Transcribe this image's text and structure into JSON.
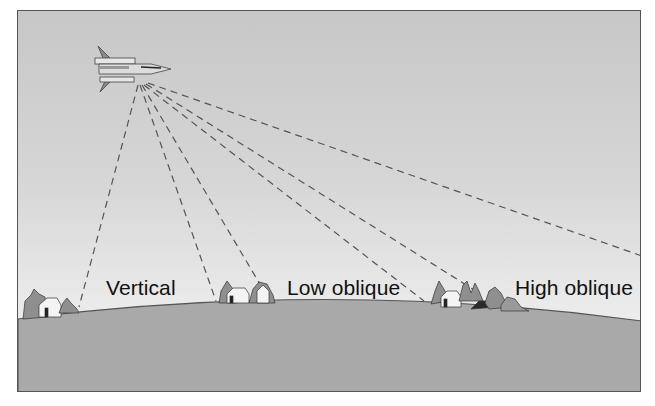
{
  "diagram": {
    "labels": {
      "vertical": "Vertical",
      "low_oblique": "Low oblique",
      "high_oblique": "High oblique"
    },
    "colors": {
      "sky_top": "#c7c7c7",
      "sky_bottom": "#f2f2f2",
      "ground": "#a9a9a9",
      "horizon_line": "#555555",
      "dash_line": "#555555",
      "text": "#111111"
    },
    "aircraft": {
      "icon": "jet-aircraft-icon",
      "x": 140,
      "y": 82
    },
    "sight_lines": [
      {
        "name": "vertical-left",
        "to": [
          78,
          306
        ]
      },
      {
        "name": "vertical-right",
        "to": [
          215,
          300
        ]
      },
      {
        "name": "low-oblique-1",
        "to": [
          263,
          290
        ]
      },
      {
        "name": "low-oblique-2",
        "to": [
          423,
          300
        ]
      },
      {
        "name": "high-oblique-1",
        "to": [
          478,
          292
        ]
      },
      {
        "name": "high-oblique-horizon",
        "to": [
          641,
          255
        ]
      }
    ],
    "house_clusters": [
      {
        "name": "vertical-target",
        "x": 22,
        "y": 288
      },
      {
        "name": "low-oblique-target",
        "x": 218,
        "y": 278
      },
      {
        "name": "high-oblique-target",
        "x": 430,
        "y": 280
      }
    ]
  }
}
